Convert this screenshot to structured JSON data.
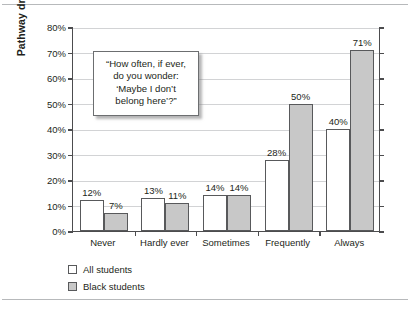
{
  "chart_data": {
    "type": "bar",
    "title": "",
    "xlabel": "",
    "ylabel": "Pathway dropout",
    "categories": [
      "Never",
      "Hardly ever",
      "Sometimes",
      "Frequently",
      "Always"
    ],
    "series": [
      {
        "name": "All students",
        "values": [
          12,
          13,
          14,
          28,
          40
        ],
        "labels": [
          "12%",
          "13%",
          "14%",
          "28%",
          "40%"
        ],
        "color": "#ffffff"
      },
      {
        "name": "Black students",
        "values": [
          7,
          11,
          14,
          50,
          71
        ],
        "labels": [
          "7%",
          "11%",
          "14%",
          "50%",
          "71%"
        ],
        "color": "#c8c8c8"
      }
    ],
    "ylim": [
      0,
      80
    ],
    "y_ticks": [
      0,
      10,
      20,
      30,
      40,
      50,
      60,
      70,
      80
    ],
    "y_tick_labels": [
      "0%",
      "10%",
      "20%",
      "30%",
      "40%",
      "50%",
      "60%",
      "70%",
      "80%"
    ],
    "grid": true,
    "legend_position": "bottom-left",
    "annotation": {
      "lines": [
        "“How often, if ever,",
        "do you wonder:",
        "‘Maybe I don’t",
        "belong here’?”"
      ]
    }
  },
  "colors": {
    "axis": "#4c4c4e",
    "grid": "#d2d3d5",
    "bar_outline": "#58595b",
    "text": "#231f20",
    "frame_rule": "#b7b9bb"
  }
}
